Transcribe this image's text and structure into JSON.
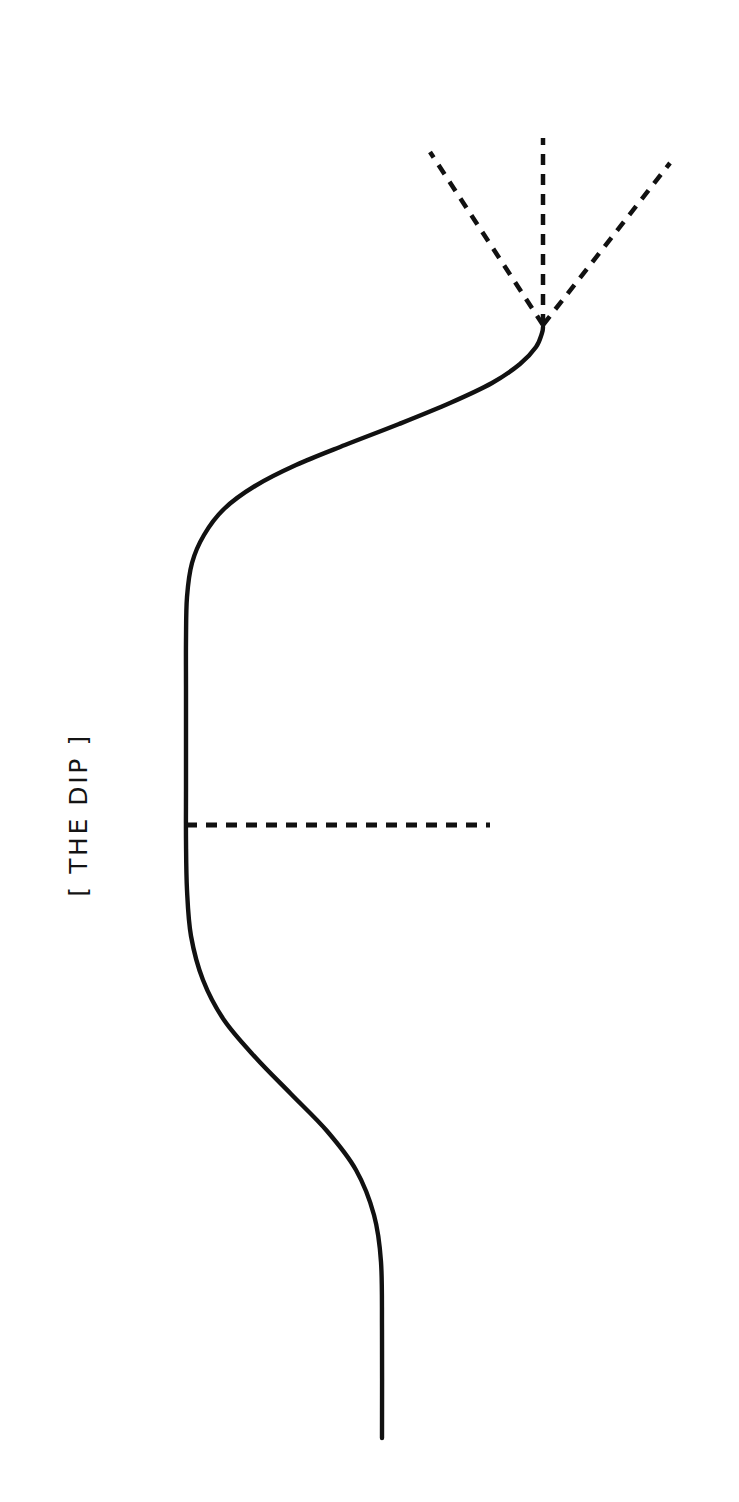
{
  "figure": {
    "title_label": "[ THE DIP ]",
    "background_color": "#ffffff",
    "stroke_color": "#111111",
    "orientation": "rotated-90",
    "width": 739,
    "height": 1502
  },
  "chart_data": {
    "type": "line",
    "title": "[ THE DIP ]",
    "xlabel": "",
    "ylabel": "",
    "orientation": "rotated-90-ccw",
    "grid": false,
    "legend": false,
    "xlim": [
      0,
      739
    ],
    "ylim": [
      0,
      1502
    ],
    "annotations": [
      {
        "name": "dip-label",
        "text": "[ THE DIP ]",
        "x": 78,
        "y": 815,
        "rotation": -90
      }
    ],
    "series": [
      {
        "name": "the-dip-curve",
        "style": "solid",
        "stroke_width": 4.4,
        "description": "S-curve: starts at lower tail, plateaus through the dip, then rises steeply to the breakout point",
        "points": [
          [
            382,
            1438
          ],
          [
            382,
            1330
          ],
          [
            381,
            1262
          ],
          [
            374,
            1215
          ],
          [
            356,
            1170
          ],
          [
            327,
            1131
          ],
          [
            291,
            1094
          ],
          [
            256,
            1058
          ],
          [
            224,
            1020
          ],
          [
            203,
            980
          ],
          [
            191,
            936
          ],
          [
            187,
            890
          ],
          [
            186,
            840
          ],
          [
            186,
            790
          ],
          [
            186,
            740
          ],
          [
            186,
            690
          ],
          [
            186,
            640
          ],
          [
            187,
            597
          ],
          [
            192,
            563
          ],
          [
            204,
            535
          ],
          [
            224,
            509
          ],
          [
            255,
            486
          ],
          [
            296,
            465
          ],
          [
            345,
            445
          ],
          [
            399,
            424
          ],
          [
            450,
            403
          ],
          [
            492,
            383
          ],
          [
            520,
            364
          ],
          [
            536,
            347
          ],
          [
            542,
            333
          ],
          [
            543,
            327
          ]
        ]
      },
      {
        "name": "dip-reference-line",
        "style": "dashed",
        "stroke_width": 5,
        "dash_pattern": [
          11,
          9
        ],
        "description": "horizontal dashed reference line marking the depth of the dip",
        "points": [
          [
            186,
            825
          ],
          [
            490,
            825
          ]
        ]
      },
      {
        "name": "outcome-ray-left",
        "style": "dashed",
        "stroke_width": 4.5,
        "dash_pattern": [
          11,
          9
        ],
        "description": "dashed possible-future ray fanning up-left from the breakout point",
        "points": [
          [
            543,
            325
          ],
          [
            430,
            152
          ]
        ]
      },
      {
        "name": "outcome-ray-center",
        "style": "dashed",
        "stroke_width": 4.5,
        "dash_pattern": [
          11,
          9
        ],
        "description": "dashed possible-future ray continuing straight up from the breakout point",
        "points": [
          [
            543,
            325
          ],
          [
            543,
            138
          ]
        ]
      },
      {
        "name": "outcome-ray-right",
        "style": "dashed",
        "stroke_width": 4.5,
        "dash_pattern": [
          11,
          9
        ],
        "description": "dashed possible-future ray fanning up-right from the breakout point",
        "points": [
          [
            543,
            325
          ],
          [
            670,
            163
          ]
        ]
      }
    ],
    "key_points": [
      {
        "name": "start-tail",
        "x": 382,
        "y": 1438
      },
      {
        "name": "dip-entry",
        "x": 186,
        "y": 640
      },
      {
        "name": "dip-reference-intersect",
        "x": 186,
        "y": 825
      },
      {
        "name": "dip-exit",
        "x": 186,
        "y": 1020
      },
      {
        "name": "breakout-point",
        "x": 543,
        "y": 325
      }
    ]
  }
}
